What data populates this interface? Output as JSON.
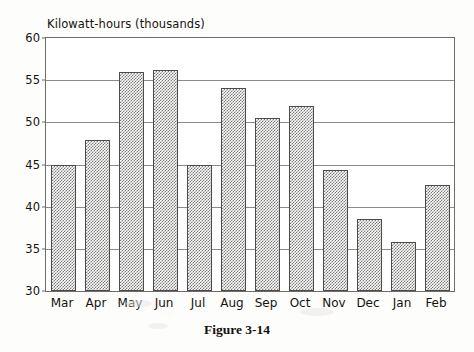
{
  "figure": {
    "caption": "Figure 3-14"
  },
  "chart_data": {
    "type": "bar",
    "title": "Kilowatt-hours (thousands)",
    "xlabel": "",
    "ylabel": "Kilowatt-hours (thousands)",
    "categories": [
      "Mar",
      "Apr",
      "May",
      "Jun",
      "Jul",
      "Aug",
      "Sep",
      "Oct",
      "Nov",
      "Dec",
      "Jan",
      "Feb"
    ],
    "values": [
      45.0,
      47.9,
      56.0,
      56.2,
      45.0,
      54.1,
      50.5,
      51.9,
      44.3,
      38.5,
      35.8,
      42.6
    ],
    "ylim": [
      30,
      60
    ],
    "yticks": [
      30,
      35,
      40,
      45,
      50,
      55,
      60
    ],
    "ytick_labels": [
      "30",
      "35",
      "40",
      "45",
      "50",
      "55",
      "60"
    ],
    "grid": true,
    "legend": false,
    "bar_fill": "gray-checker-hatch",
    "bar_edge_color": "#4c4b49",
    "axis_color": "#6d6c69",
    "grid_color": "#8b8a86",
    "text_color": "#15130f",
    "background": "#ffffff"
  }
}
